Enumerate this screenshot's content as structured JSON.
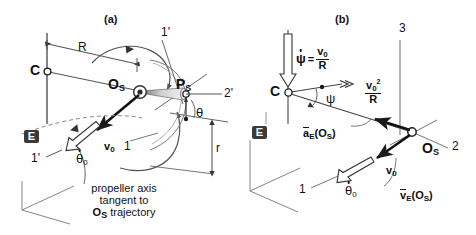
{
  "figure": {
    "type": "kinematics-diagram",
    "panels": [
      {
        "id": "a",
        "title": "(a)",
        "points": [
          {
            "name": "C",
            "label": "C",
            "role": "center-of-rotation"
          },
          {
            "name": "Os",
            "label": "O",
            "sub": "S",
            "role": "propeller-hub"
          },
          {
            "name": "Ps",
            "label": "P",
            "sub": "S",
            "role": "blade-tip"
          }
        ],
        "dimensions": [
          {
            "name": "R",
            "label": "R",
            "desc": "radius C to Os"
          },
          {
            "name": "r",
            "label": "r",
            "desc": "blade radius"
          }
        ],
        "axes": [
          {
            "label": "1",
            "kind": "body-axis"
          },
          {
            "label": "2'",
            "kind": "intermediate-axis"
          },
          {
            "label": "3'",
            "kind": "intermediate-axis"
          },
          {
            "label": "1'",
            "kind": "intermediate-axis"
          }
        ],
        "angles": [
          {
            "label": "θ",
            "name": "theta"
          }
        ],
        "velocities": [
          {
            "label": "v",
            "sub": "0",
            "name": "v0"
          },
          {
            "label": "θ",
            "sub": "0",
            "dot": true,
            "name": "theta-dot-0"
          }
        ],
        "frame_badge": "E",
        "caption_lines": [
          "propeller axis",
          "tangent to"
        ],
        "caption_last": {
          "pre": "O",
          "sub": "S",
          "post": " trajectory"
        }
      },
      {
        "id": "b",
        "title": "(b)",
        "points": [
          {
            "name": "C",
            "label": "C",
            "role": "center-of-rotation"
          },
          {
            "name": "Os",
            "label": "O",
            "sub": "S",
            "role": "propeller-hub"
          }
        ],
        "axes": [
          {
            "label": "1",
            "kind": "body-axis"
          },
          {
            "label": "2",
            "kind": "body-axis"
          },
          {
            "label": "3",
            "kind": "body-axis"
          }
        ],
        "angles": [
          {
            "label": "ψ",
            "name": "psi"
          }
        ],
        "formulas": [
          {
            "name": "psi-dot",
            "lhs": "ψ",
            "lhs_dot": true,
            "eq": "=",
            "num": "v",
            "num_sub": "0",
            "den": "R"
          },
          {
            "name": "centripetal-accel",
            "num": "v",
            "num_sub": "0",
            "num_sup": "2",
            "den": "R"
          }
        ],
        "vectors": [
          {
            "name": "a-E-Os",
            "base": "a",
            "overbar": true,
            "sub": "E",
            "arg_pre": "(",
            "arg": "O",
            "arg_sub": "S",
            "arg_post": ")"
          },
          {
            "name": "v-E-Os",
            "base": "v",
            "overbar": true,
            "sub": "E",
            "arg_pre": "(",
            "arg": "O",
            "arg_sub": "S",
            "arg_post": ")"
          }
        ],
        "velocities": [
          {
            "label": "v",
            "sub": "0",
            "name": "v0"
          },
          {
            "label": "θ",
            "sub": "0",
            "dot": true,
            "name": "theta-dot-0"
          }
        ],
        "frame_badge": "E"
      }
    ],
    "colors": {
      "line": "#222222",
      "thin_line": "#7a7a7a",
      "badge_bg": "#3a3a3a",
      "badge_fg": "#ffffff",
      "cone_light": "#f2f2f2",
      "cone_dark": "#8a8a8a",
      "background": "#ffffff"
    }
  }
}
